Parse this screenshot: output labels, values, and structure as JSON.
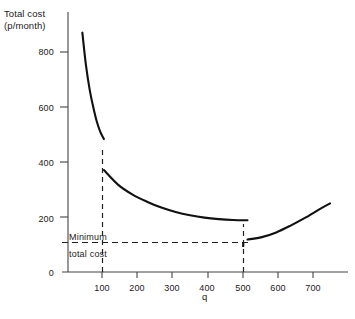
{
  "chart": {
    "y_axis_title_line1": "Total cost",
    "y_axis_title_line2": "(p/month)",
    "x_axis_title": "q",
    "annotation_line1": "Minimum",
    "annotation_line2": "total cost",
    "y_tick_labels": [
      "0",
      "200",
      "400",
      "600",
      "800"
    ],
    "x_tick_labels": [
      "100",
      "200",
      "300",
      "400",
      "500",
      "600",
      "700"
    ],
    "line_color": "#111111",
    "axis_color": "#444444",
    "dash_color": "#222222"
  },
  "chart_data": {
    "type": "line",
    "title": "",
    "subtitle": "",
    "xlabel": "q",
    "ylabel": "Total cost (p/month)",
    "xlim": [
      0,
      780
    ],
    "ylim": [
      0,
      880
    ],
    "xticks": [
      100,
      200,
      300,
      400,
      500,
      600,
      700
    ],
    "yticks": [
      0,
      200,
      400,
      600,
      800
    ],
    "grid": false,
    "legend": false,
    "annotations": [
      {
        "text": "Minimum total cost",
        "x": 100,
        "y": 110,
        "describes": "horizontal dashed line marking the minimum total cost level of about 110 p/month, reached at q = 500"
      }
    ],
    "reference_lines": [
      {
        "orientation": "horizontal",
        "y": 110,
        "style": "dashed",
        "label": "Minimum total cost",
        "x_from": 62,
        "x_to": 520
      },
      {
        "orientation": "vertical",
        "x": 100,
        "style": "dashed",
        "y_from": 0,
        "y_to": 450
      },
      {
        "orientation": "vertical",
        "x": 500,
        "style": "dashed",
        "y_from": 0,
        "y_to": 175
      }
    ],
    "discontinuities": [
      {
        "x": 100,
        "y_before": 450,
        "y_after": 345,
        "note": "price-break drop in total cost at q = 100"
      },
      {
        "x": 500,
        "y_before": 175,
        "y_after": 110,
        "note": "price-break drop in total cost at q = 500; minimum total cost"
      }
    ],
    "series": [
      {
        "name": "Total cost segment 1 (q < 100)",
        "x": [
          40,
          50,
          60,
          70,
          80,
          90,
          100
        ],
        "values": [
          810,
          700,
          620,
          560,
          510,
          474,
          450
        ]
      },
      {
        "name": "Total cost segment 2 (100 <= q < 500)",
        "x": [
          100,
          140,
          180,
          220,
          260,
          300,
          340,
          380,
          420,
          460,
          500
        ],
        "values": [
          345,
          295,
          262,
          238,
          218,
          203,
          192,
          184,
          179,
          176,
          175
        ]
      },
      {
        "name": "Total cost segment 3 (q >= 500)",
        "x": [
          500,
          540,
          580,
          620,
          660,
          700,
          730
        ],
        "values": [
          110,
          118,
          134,
          157,
          183,
          212,
          232
        ]
      }
    ]
  }
}
